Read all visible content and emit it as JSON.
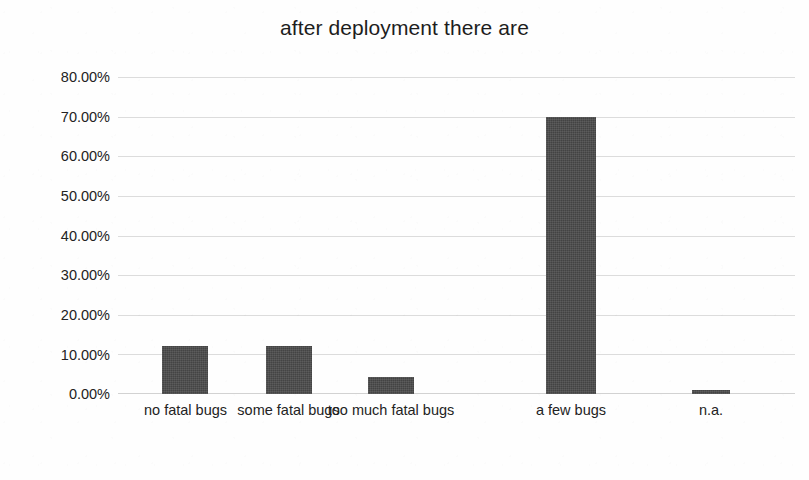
{
  "chart_data": {
    "type": "bar",
    "title": "after deployment there are",
    "xlabel": "",
    "ylabel": "",
    "categories": [
      "no fatal bugs",
      "some fatal bugs",
      "too much fatal bugs",
      "a few bugs",
      "n.a."
    ],
    "values": [
      12.0,
      12.0,
      4.3,
      70.0,
      1.0
    ],
    "value_labels": [
      "12.00%",
      "12.00%",
      "4.30%",
      "70.00%",
      "1.00%"
    ],
    "ylim": [
      0,
      80
    ],
    "ytick_values": [
      0,
      10,
      20,
      30,
      40,
      50,
      60,
      70,
      80
    ],
    "ytick_labels": [
      "0.00%",
      "10.00%",
      "20.00%",
      "30.00%",
      "40.00%",
      "50.00%",
      "60.00%",
      "70.00%",
      "80.00%"
    ],
    "grid": true,
    "grid_axis": "y",
    "legend": false,
    "legend_position": "none",
    "series": [
      {
        "name": "after deployment there are",
        "values": [
          12.0,
          12.0,
          4.3,
          70.0,
          1.0
        ],
        "color": "#4a4a4a"
      }
    ],
    "annotations": []
  },
  "colors": {
    "bar": "#4a4a4a",
    "gridline": "#dcdcdc",
    "baseline": "#d2d2d2",
    "text": "#232323",
    "title_text": "#1d1d1d",
    "background": "#fefefe"
  },
  "axis": {
    "y_labels": [
      "80.00%",
      "70.00%",
      "60.00%",
      "50.00%",
      "40.00%",
      "30.00%",
      "20.00%",
      "10.00%",
      "0.00%"
    ],
    "x_labels": [
      "no fatal bugs",
      "some fatal bugs",
      "too much fatal bugs",
      "a few bugs",
      "n.a."
    ]
  }
}
